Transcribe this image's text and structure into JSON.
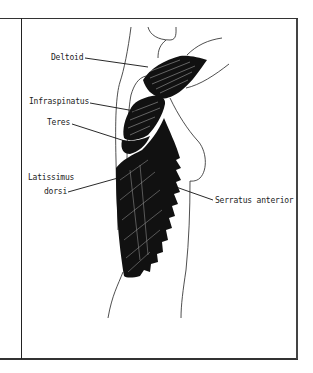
{
  "figure": {
    "type": "anatomical-illustration",
    "labels": {
      "deltoid": "Deltoid",
      "infraspinatus": "Infraspinatus",
      "teres": "Teres",
      "latissimus_line1": "Latissimus",
      "latissimus_line2": "dorsi",
      "serratus": "Serratus anterior"
    },
    "colors": {
      "ink": "#111111",
      "border": "#333333",
      "background": "#ffffff"
    }
  }
}
